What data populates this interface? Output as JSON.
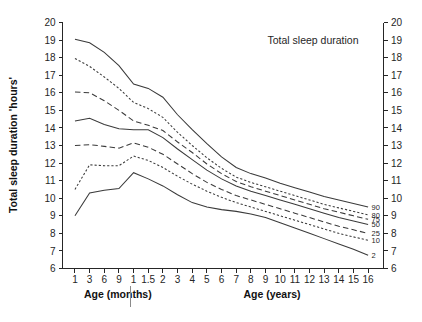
{
  "chart_data": {
    "type": "line",
    "title": "Total sleep duration",
    "xlabel_left": "Age (months)",
    "xlabel_right": "Age (years)",
    "ylabel": "Total sleep duration 'hours'",
    "ylim": [
      6,
      20
    ],
    "y_ticks": [
      20,
      19,
      18,
      17,
      16,
      15,
      14,
      13,
      12,
      11,
      10,
      9,
      8,
      7,
      6
    ],
    "y_ticks_right": [
      20,
      19,
      18,
      17,
      16,
      15,
      14,
      13,
      12,
      11,
      10,
      9,
      8,
      7,
      6
    ],
    "grid": false,
    "legend_position": "right-inline",
    "x_tick_labels": [
      "1",
      "3",
      "6",
      "9",
      "1",
      "1.5",
      "2",
      "3",
      "4",
      "5",
      "6",
      "7",
      "8",
      "9",
      "10",
      "11",
      "12",
      "13",
      "14",
      "15",
      "16"
    ],
    "x_tick_units": [
      "months",
      "months",
      "months",
      "months",
      "years",
      "years",
      "years",
      "years",
      "years",
      "years",
      "years",
      "years",
      "years",
      "years",
      "years",
      "years",
      "years",
      "years",
      "years",
      "years",
      "years"
    ],
    "series": [
      {
        "name": "90",
        "style": "solid",
        "values": [
          19.05,
          18.85,
          18.3,
          17.55,
          16.5,
          16.25,
          15.75,
          14.75,
          13.9,
          13.1,
          12.35,
          11.75,
          11.4,
          11.15,
          10.85,
          10.6,
          10.35,
          10.1,
          9.9,
          9.7,
          9.5
        ]
      },
      {
        "name": "80",
        "style": "dotted",
        "values": [
          17.95,
          17.5,
          16.9,
          16.25,
          15.45,
          15.1,
          14.6,
          13.75,
          13.0,
          12.3,
          11.7,
          11.2,
          10.9,
          10.65,
          10.4,
          10.15,
          9.9,
          9.65,
          9.45,
          9.25,
          9.05
        ]
      },
      {
        "name": "75",
        "style": "dashed",
        "values": [
          16.05,
          16.0,
          15.55,
          15.0,
          14.4,
          14.15,
          13.85,
          13.2,
          12.6,
          11.95,
          11.4,
          10.95,
          10.65,
          10.4,
          10.15,
          9.9,
          9.65,
          9.4,
          9.2,
          9.0,
          8.8
        ]
      },
      {
        "name": "50",
        "style": "solid",
        "values": [
          14.4,
          14.55,
          14.2,
          13.95,
          13.9,
          13.9,
          13.45,
          12.8,
          12.2,
          11.6,
          11.1,
          10.7,
          10.4,
          10.15,
          9.9,
          9.65,
          9.4,
          9.15,
          8.9,
          8.7,
          8.5
        ]
      },
      {
        "name": "25",
        "style": "dashed",
        "values": [
          13.0,
          13.05,
          12.95,
          12.85,
          13.15,
          12.9,
          12.5,
          11.95,
          11.4,
          10.9,
          10.5,
          10.15,
          9.9,
          9.65,
          9.4,
          9.15,
          8.9,
          8.65,
          8.4,
          8.2,
          8.0
        ]
      },
      {
        "name": "10",
        "style": "dotted",
        "values": [
          10.5,
          11.9,
          11.85,
          11.85,
          12.4,
          12.15,
          11.75,
          11.25,
          10.8,
          10.4,
          10.05,
          9.75,
          9.5,
          9.25,
          9.0,
          8.75,
          8.5,
          8.25,
          8.0,
          7.8,
          7.6
        ]
      },
      {
        "name": "2",
        "style": "solid",
        "values": [
          9.0,
          10.3,
          10.45,
          10.55,
          11.45,
          11.1,
          10.7,
          10.2,
          9.75,
          9.5,
          9.35,
          9.25,
          9.1,
          8.9,
          8.6,
          8.3,
          8.0,
          7.7,
          7.4,
          7.1,
          6.75
        ]
      }
    ]
  },
  "legend": {
    "labels": [
      "90",
      "80",
      "75",
      "50",
      "25",
      "10",
      "2"
    ]
  }
}
